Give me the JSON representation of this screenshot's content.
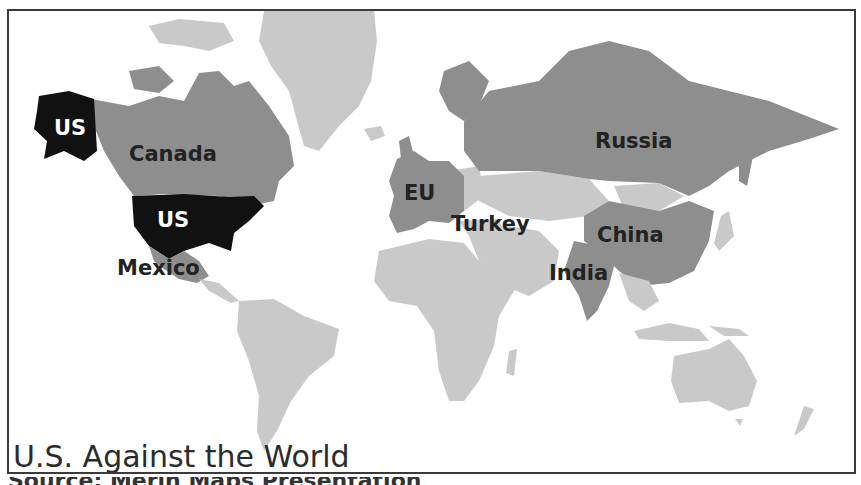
{
  "map": {
    "title": "U.S. Against the World",
    "colors": {
      "us": "#111111",
      "highlighted": "#8e8e8e",
      "other": "#c9c9c9",
      "frame": "#3a3a3a",
      "background": "#ffffff"
    },
    "labels": {
      "us_alaska": "US",
      "us_mainland": "US",
      "canada": "Canada",
      "mexico": "Mexico",
      "eu": "EU",
      "turkey": "Turkey",
      "russia": "Russia",
      "china": "China",
      "india": "India"
    },
    "footer_partial": "Source: Merin Maps Presentation"
  }
}
